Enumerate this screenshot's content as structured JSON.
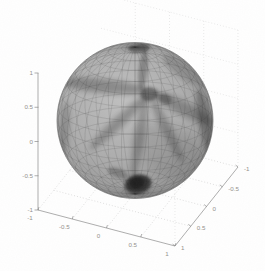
{
  "figure": {
    "background": "#ffffff",
    "colors": {
      "axis": "#8a8a8a",
      "tick_label": "#94908b",
      "floor_grid": "#c9c9c9",
      "wall_grid": "#dcdcdc",
      "mesh_line": "#3f3f3f",
      "sphere_edge": "#7a7a7a",
      "sphere_light": "#bfbfbf",
      "sphere_mid": "#adadad",
      "sphere_dark": "#8d8d8d",
      "dark_patch": "#1c1c1c"
    },
    "dark_regions": [
      {
        "cx": 139,
        "cy": 48,
        "rx": 11,
        "ry": 4.5,
        "rot": -5,
        "o": 0.5,
        "b": "s"
      },
      {
        "cx": 143,
        "cy": 70,
        "rx": 4.5,
        "ry": 20,
        "rot": 6,
        "o": 0.3,
        "b": "s"
      },
      {
        "cx": 149,
        "cy": 94,
        "rx": 9,
        "ry": 7,
        "rot": 0,
        "o": 0.45,
        "b": "s"
      },
      {
        "cx": 165,
        "cy": 99,
        "rx": 7,
        "ry": 5,
        "rot": 20,
        "o": 0.32,
        "b": "s"
      },
      {
        "cx": 103,
        "cy": 86,
        "rx": 44,
        "ry": 7,
        "rot": 6,
        "o": 0.3,
        "b": "m"
      },
      {
        "cx": 183,
        "cy": 108,
        "rx": 34,
        "ry": 7,
        "rot": 27,
        "o": 0.28,
        "b": "m"
      },
      {
        "cx": 119,
        "cy": 122,
        "rx": 40,
        "ry": 5.5,
        "rot": 137,
        "o": 0.28,
        "b": "m"
      },
      {
        "cx": 139,
        "cy": 139,
        "rx": 42,
        "ry": 5,
        "rot": 99,
        "o": 0.26,
        "b": "m"
      },
      {
        "cx": 167,
        "cy": 130,
        "rx": 36,
        "ry": 5,
        "rot": 64,
        "o": 0.26,
        "b": "m"
      },
      {
        "cx": 207,
        "cy": 128,
        "rx": 40,
        "ry": 7,
        "rot": 78,
        "o": 0.36,
        "b": "m"
      },
      {
        "cx": 64,
        "cy": 132,
        "rx": 30,
        "ry": 5,
        "rot": 95,
        "o": 0.22,
        "b": "m"
      },
      {
        "cx": 185,
        "cy": 71,
        "rx": 27,
        "ry": 8,
        "rot": 35,
        "o": 0.2,
        "b": "m"
      },
      {
        "cx": 170,
        "cy": 152,
        "rx": 40,
        "ry": 24,
        "rot": 30,
        "o": 0.1,
        "b": "l"
      },
      {
        "cx": 118,
        "cy": 173,
        "rx": 11,
        "ry": 4.5,
        "rot": 20,
        "o": 0.28,
        "b": "s"
      },
      {
        "cx": 138,
        "cy": 184,
        "rx": 13.5,
        "ry": 9.5,
        "rot": -10,
        "o": 0.78,
        "b": "s"
      },
      {
        "cx": 137,
        "cy": 183,
        "rx": 8,
        "ry": 6,
        "rot": -10,
        "o": 0.85,
        "b": "s"
      }
    ]
  },
  "axes": {
    "x": {
      "tick_labels": [
        "1",
        "0.5",
        "0",
        "-0.5",
        "-1"
      ]
    },
    "y": {
      "tick_labels": [
        "1",
        "0.5",
        "0",
        "-0.5",
        "-1"
      ]
    },
    "z": {
      "tick_labels": [
        "1",
        "0.5",
        "0",
        "-0.5",
        "-1"
      ]
    }
  },
  "chart_data": {
    "type": "surface",
    "title": "",
    "xlabel": "",
    "ylabel": "",
    "zlabel": "",
    "xlim": [
      -1,
      1
    ],
    "ylim": [
      -1,
      1
    ],
    "zlim": [
      -1,
      1
    ],
    "x_ticks": [
      1,
      0.5,
      0,
      -0.5,
      -1
    ],
    "y_ticks": [
      1,
      0.5,
      0,
      -0.5,
      -1
    ],
    "z_ticks": [
      1,
      0.5,
      0,
      -0.5,
      -1
    ],
    "grid": true,
    "legend": false,
    "surface": {
      "shape": "sphere",
      "radius": 1,
      "center": [
        0,
        0,
        0
      ],
      "style": "shaded lat-long wireframe mesh, gray colormap with irregular dark patches",
      "features": [
        "dark spot at north pole",
        "dark knot just right of center with streaks radiating down-left, down, down-right and to the right limb",
        "dark band across upper hemisphere to left limb",
        "dark band along right limb",
        "large near-black blob near south pole"
      ]
    },
    "view": {
      "elevation_deg": 20,
      "azimuth_deg": -37.5
    }
  }
}
